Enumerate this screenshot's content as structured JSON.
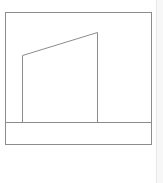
{
  "diagram": {
    "stroke_color": "#8c8c8c",
    "background": "#ffffff",
    "frame": {
      "x": 5,
      "y": 12,
      "width": 146,
      "height": 132
    },
    "ground_line": {
      "x1": 5,
      "y1": 122,
      "x2": 151,
      "y2": 122
    },
    "shape": {
      "points": "22,122 22,55 97,32 97,122",
      "vertices": [
        [
          22,
          122
        ],
        [
          22,
          55
        ],
        [
          97,
          32
        ],
        [
          97,
          122
        ]
      ]
    }
  },
  "scrollbar": {
    "color": "#f7f7f7"
  }
}
